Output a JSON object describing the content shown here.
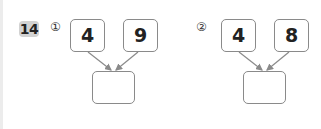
{
  "problem": {
    "number": "14",
    "parts": [
      {
        "marker": "①",
        "left_value": "4",
        "right_value": "9",
        "answer": ""
      },
      {
        "marker": "②",
        "left_value": "4",
        "right_value": "8",
        "answer": ""
      }
    ]
  },
  "colors": {
    "badge_bg": "#d2d2d2",
    "box_border": "#8a8a8a",
    "arrow": "#8a8a8a"
  }
}
